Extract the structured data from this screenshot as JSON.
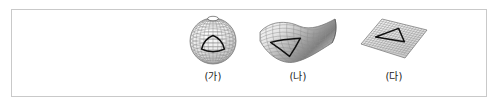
{
  "figure": {
    "background_color": "#ffffff",
    "border_color": "#c9c9c9",
    "mesh_color": "#8c8c8c",
    "triangle_color": "#111111",
    "label_color": "#1c1c1c"
  },
  "panels": [
    {
      "label": "(가)",
      "icon": "sphere-surface-icon",
      "surface_type": "sphere",
      "curvature": "positive",
      "triangle_sides": "convex"
    },
    {
      "label": "(나)",
      "icon": "saddle-surface-icon",
      "surface_type": "saddle",
      "curvature": "negative",
      "triangle_sides": "concave"
    },
    {
      "label": "(다)",
      "icon": "plane-surface-icon",
      "surface_type": "plane",
      "curvature": "zero",
      "triangle_sides": "straight"
    }
  ]
}
